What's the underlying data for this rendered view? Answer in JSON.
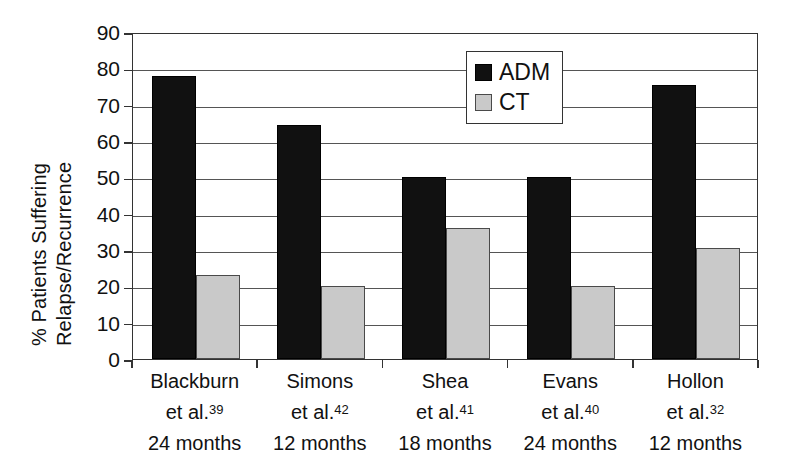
{
  "chart_data": {
    "type": "bar",
    "title": "",
    "xlabel": "",
    "ylabel": "% Patients Suffering Relapse/Recurrence",
    "ylabel_lines": [
      "% Patients Suffering",
      "Relapse/Recurrence"
    ],
    "ylim": [
      0,
      90
    ],
    "ytick_values": [
      90,
      80,
      70,
      60,
      50,
      40,
      30,
      20,
      10,
      0
    ],
    "ytick_labels": [
      "90",
      "80",
      "70",
      "60",
      "50",
      "40",
      "30",
      "20",
      "10",
      "0"
    ],
    "grid": true,
    "legend_position": "upper-center-right",
    "categories": [
      "Blackburn et al.39 24 months",
      "Simons et al.42 12 months",
      "Shea et al.41 18 months",
      "Evans et al.40 24 months",
      "Hollon et al.32 12 months"
    ],
    "category_lines": [
      {
        "author": "Blackburn",
        "citation_text": "et al.",
        "citation_ref": "39",
        "duration": "24 months"
      },
      {
        "author": "Simons",
        "citation_text": "et al.",
        "citation_ref": "42",
        "duration": "12 months"
      },
      {
        "author": "Shea",
        "citation_text": "et al.",
        "citation_ref": "41",
        "duration": "18 months"
      },
      {
        "author": "Evans",
        "citation_text": "et al.",
        "citation_ref": "40",
        "duration": "24 months"
      },
      {
        "author": "Hollon",
        "citation_text": "et al.",
        "citation_ref": "32",
        "duration": "12 months"
      }
    ],
    "series": [
      {
        "name": "ADM",
        "color": "#111111",
        "values": [
          78,
          64.5,
          50,
          50,
          75.5
        ]
      },
      {
        "name": "CT",
        "color": "#c9c9c9",
        "values": [
          23,
          20,
          36,
          20,
          30.5
        ]
      }
    ]
  },
  "legend": {
    "items": [
      {
        "label": "ADM",
        "color": "#111111"
      },
      {
        "label": "CT",
        "color": "#c9c9c9"
      }
    ]
  },
  "colors": {
    "adm": "#111111",
    "ct": "#c9c9c9",
    "axis": "#333333",
    "grid": "#555555",
    "background": "#ffffff"
  }
}
